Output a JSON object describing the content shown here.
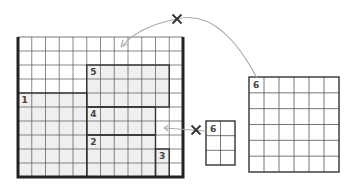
{
  "diagram": {
    "board": {
      "columns": 12,
      "rows": 10,
      "regions": [
        {
          "label": "5",
          "col": 5,
          "row": 2,
          "cols": 6,
          "rows": 3,
          "shaded": true
        },
        {
          "label": "1",
          "col": 0,
          "row": 4,
          "cols": 5,
          "rows": 6,
          "shaded": true
        },
        {
          "label": "4",
          "col": 5,
          "row": 5,
          "cols": 5,
          "rows": 2,
          "shaded": true
        },
        {
          "label": "2",
          "col": 5,
          "row": 7,
          "cols": 5,
          "rows": 3,
          "shaded": true
        },
        {
          "label": "3",
          "col": 10,
          "row": 8,
          "cols": 1,
          "rows": 2,
          "shaded": true
        }
      ]
    },
    "pieces": [
      {
        "label": "6",
        "columns": 2,
        "rows": 3,
        "role": "small-piece"
      },
      {
        "label": "6",
        "columns": 6,
        "rows": 6,
        "role": "large-piece"
      }
    ],
    "arrows": [
      {
        "from": "large-piece",
        "to": "board-top",
        "crossed": true,
        "cross_glyph": "×"
      },
      {
        "from": "small-piece",
        "to": "board-gap",
        "crossed": true,
        "cross_glyph": "×"
      }
    ],
    "colors": {
      "grid_line": "#555555",
      "region_border": "#333333",
      "board_border": "#222222",
      "shade": "#efefef",
      "arrow": "#a8a8a8",
      "cross": "#333333",
      "label": "#444444"
    }
  }
}
